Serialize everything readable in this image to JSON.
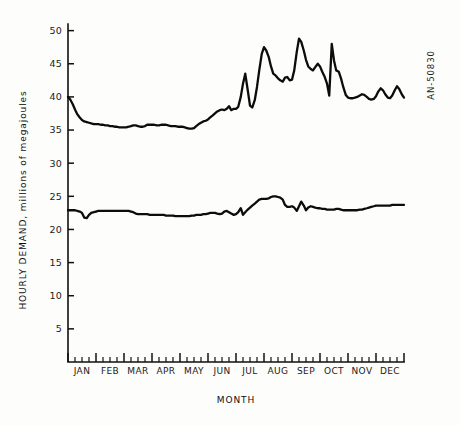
{
  "chart_data": {
    "type": "line",
    "title": "",
    "xlabel": "MONTH",
    "ylabel": "HOURLY DEMAND, millions of megajoules",
    "ylim": [
      0,
      51
    ],
    "xlim": [
      0,
      12
    ],
    "grid": false,
    "legend": false,
    "y_ticks": [
      5,
      10,
      15,
      20,
      25,
      30,
      35,
      40,
      45,
      50
    ],
    "categories": [
      "JAN",
      "FEB",
      "MAR",
      "APR",
      "MAY",
      "JUN",
      "JUL",
      "AUG",
      "SEP",
      "OCT",
      "NOV",
      "DEC"
    ],
    "minor_ticks_per_month": 4,
    "x_unit": "month index (0 = start of JAN, 12 = end of DEC)",
    "series": [
      {
        "name": "upper",
        "x": [
          0.0,
          0.08,
          0.17,
          0.25,
          0.33,
          0.42,
          0.5,
          0.58,
          0.67,
          0.75,
          0.83,
          0.92,
          1.0,
          1.08,
          1.17,
          1.25,
          1.33,
          1.42,
          1.5,
          1.58,
          1.67,
          1.75,
          1.83,
          1.92,
          2.0,
          2.08,
          2.17,
          2.25,
          2.33,
          2.42,
          2.5,
          2.58,
          2.67,
          2.75,
          2.83,
          2.92,
          3.0,
          3.08,
          3.17,
          3.25,
          3.33,
          3.42,
          3.5,
          3.58,
          3.67,
          3.75,
          3.83,
          3.92,
          4.0,
          4.08,
          4.17,
          4.25,
          4.33,
          4.42,
          4.5,
          4.58,
          4.67,
          4.75,
          4.83,
          4.92,
          5.0,
          5.08,
          5.17,
          5.25,
          5.33,
          5.42,
          5.5,
          5.58,
          5.67,
          5.75,
          5.83,
          5.92,
          6.0,
          6.08,
          6.17,
          6.25,
          6.33,
          6.42,
          6.5,
          6.58,
          6.67,
          6.75,
          6.83,
          6.92,
          7.0,
          7.08,
          7.17,
          7.25,
          7.33,
          7.42,
          7.5,
          7.58,
          7.67,
          7.75,
          7.83,
          7.92,
          8.0,
          8.08,
          8.17,
          8.25,
          8.33,
          8.42,
          8.5,
          8.58,
          8.67,
          8.75,
          8.83,
          8.92,
          9.0,
          9.08,
          9.17,
          9.25,
          9.33,
          9.42,
          9.5,
          9.58,
          9.67,
          9.75,
          9.83,
          9.92,
          10.0,
          10.08,
          10.17,
          10.25,
          10.33,
          10.42,
          10.5,
          10.58,
          10.67,
          10.75,
          10.83,
          10.92,
          11.0,
          11.08,
          11.17,
          11.25,
          11.33,
          11.42,
          11.5,
          11.58,
          11.67,
          11.75,
          11.83,
          11.92,
          12.0
        ],
        "y": [
          40.0,
          39.6,
          38.9,
          38.1,
          37.4,
          36.9,
          36.5,
          36.3,
          36.2,
          36.1,
          36.0,
          35.9,
          35.9,
          35.9,
          35.8,
          35.8,
          35.7,
          35.7,
          35.6,
          35.6,
          35.5,
          35.5,
          35.4,
          35.4,
          35.4,
          35.4,
          35.5,
          35.6,
          35.7,
          35.7,
          35.6,
          35.5,
          35.5,
          35.6,
          35.8,
          35.8,
          35.8,
          35.8,
          35.7,
          35.7,
          35.8,
          35.8,
          35.8,
          35.7,
          35.6,
          35.6,
          35.6,
          35.5,
          35.5,
          35.5,
          35.4,
          35.3,
          35.2,
          35.2,
          35.3,
          35.6,
          35.9,
          36.1,
          36.3,
          36.4,
          36.6,
          36.9,
          37.2,
          37.5,
          37.8,
          38.0,
          38.1,
          38.0,
          38.2,
          38.6,
          38.0,
          38.2,
          38.2,
          38.5,
          40.0,
          42.0,
          43.5,
          41.0,
          38.7,
          38.4,
          39.5,
          41.5,
          44.0,
          46.5,
          47.5,
          47.0,
          46.0,
          44.6,
          43.5,
          43.2,
          42.8,
          42.5,
          42.3,
          42.9,
          43.0,
          42.5,
          42.6,
          44.0,
          46.8,
          48.8,
          48.3,
          47.0,
          45.6,
          44.6,
          44.2,
          44.0,
          44.5,
          45.0,
          44.6,
          43.8,
          43.0,
          42.0,
          40.2,
          48.0,
          45.5,
          44.0,
          43.8,
          42.8,
          41.5,
          40.3,
          39.9,
          39.8,
          39.8,
          39.9,
          40.0,
          40.2,
          40.4,
          40.3,
          40.0,
          39.7,
          39.6,
          39.7,
          40.1,
          40.8,
          41.3,
          41.0,
          40.4,
          39.9,
          39.8,
          40.2,
          41.0,
          41.6,
          41.2,
          40.4,
          39.9
        ]
      },
      {
        "name": "lower",
        "x": [
          0.0,
          0.08,
          0.17,
          0.25,
          0.33,
          0.42,
          0.5,
          0.58,
          0.67,
          0.75,
          0.83,
          0.92,
          1.0,
          1.08,
          1.17,
          1.25,
          1.33,
          1.42,
          1.5,
          1.58,
          1.67,
          1.75,
          1.83,
          1.92,
          2.0,
          2.08,
          2.17,
          2.25,
          2.33,
          2.42,
          2.5,
          2.58,
          2.67,
          2.75,
          2.83,
          2.92,
          3.0,
          3.08,
          3.17,
          3.25,
          3.33,
          3.42,
          3.5,
          3.58,
          3.67,
          3.75,
          3.83,
          3.92,
          4.0,
          4.08,
          4.17,
          4.25,
          4.33,
          4.42,
          4.5,
          4.58,
          4.67,
          4.75,
          4.83,
          4.92,
          5.0,
          5.08,
          5.17,
          5.25,
          5.33,
          5.42,
          5.5,
          5.58,
          5.67,
          5.75,
          5.83,
          5.92,
          6.0,
          6.08,
          6.17,
          6.25,
          6.33,
          6.42,
          6.5,
          6.58,
          6.67,
          6.75,
          6.83,
          6.92,
          7.0,
          7.08,
          7.17,
          7.25,
          7.33,
          7.42,
          7.5,
          7.58,
          7.67,
          7.75,
          7.83,
          7.92,
          8.0,
          8.08,
          8.17,
          8.25,
          8.33,
          8.42,
          8.5,
          8.58,
          8.67,
          8.75,
          8.83,
          8.92,
          9.0,
          9.08,
          9.17,
          9.25,
          9.33,
          9.42,
          9.5,
          9.58,
          9.67,
          9.75,
          9.83,
          9.92,
          10.0,
          10.08,
          10.17,
          10.25,
          10.33,
          10.42,
          10.5,
          10.58,
          10.67,
          10.75,
          10.83,
          10.92,
          11.0,
          11.08,
          11.17,
          11.25,
          11.33,
          11.42,
          11.5,
          11.58,
          11.67,
          11.75,
          11.83,
          11.92,
          12.0
        ],
        "y": [
          22.9,
          22.9,
          22.9,
          22.9,
          22.8,
          22.7,
          22.5,
          21.8,
          21.7,
          22.2,
          22.5,
          22.6,
          22.7,
          22.8,
          22.8,
          22.8,
          22.8,
          22.8,
          22.8,
          22.8,
          22.8,
          22.8,
          22.8,
          22.8,
          22.8,
          22.8,
          22.8,
          22.7,
          22.6,
          22.4,
          22.3,
          22.3,
          22.3,
          22.3,
          22.3,
          22.2,
          22.2,
          22.2,
          22.2,
          22.2,
          22.2,
          22.2,
          22.1,
          22.1,
          22.1,
          22.1,
          22.0,
          22.0,
          22.0,
          22.0,
          22.0,
          22.0,
          22.0,
          22.1,
          22.1,
          22.2,
          22.2,
          22.2,
          22.3,
          22.3,
          22.4,
          22.5,
          22.5,
          22.5,
          22.4,
          22.3,
          22.4,
          22.7,
          22.8,
          22.6,
          22.4,
          22.2,
          22.3,
          22.6,
          23.2,
          22.2,
          22.6,
          23.0,
          23.3,
          23.6,
          23.9,
          24.2,
          24.5,
          24.6,
          24.6,
          24.6,
          24.7,
          24.9,
          25.0,
          25.0,
          24.9,
          24.8,
          24.5,
          23.7,
          23.4,
          23.4,
          23.5,
          23.3,
          22.8,
          23.5,
          24.2,
          23.6,
          22.9,
          23.3,
          23.5,
          23.4,
          23.3,
          23.2,
          23.2,
          23.1,
          23.1,
          23.0,
          23.0,
          23.0,
          23.0,
          23.1,
          23.1,
          23.0,
          22.9,
          22.9,
          22.9,
          22.9,
          22.9,
          22.9,
          22.9,
          23.0,
          23.0,
          23.1,
          23.2,
          23.3,
          23.4,
          23.5,
          23.6,
          23.6,
          23.6,
          23.6,
          23.6,
          23.6,
          23.6,
          23.7,
          23.7,
          23.7,
          23.7,
          23.7,
          23.7
        ]
      }
    ]
  },
  "annotations": {
    "corner_code": "AN-50830"
  }
}
